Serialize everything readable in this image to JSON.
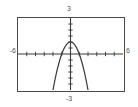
{
  "graph": {
    "window": {
      "xmin_label": "-6",
      "xmax_label": "6",
      "ymin_label": "-3",
      "ymax_label": "3"
    }
  },
  "chart_data": {
    "type": "line",
    "title": "",
    "subtitle": "",
    "xlabel": "",
    "ylabel": "",
    "xlim": [
      -6,
      6
    ],
    "ylim": [
      -3,
      3
    ],
    "grid": false,
    "legend": null,
    "axes": {
      "x_axis_visible": true,
      "y_axis_visible": true,
      "x_tick_labels": [
        "-6",
        "6"
      ],
      "y_tick_labels": [
        "-3",
        "3"
      ],
      "x_tick_interval": 1,
      "y_tick_interval": 0.5,
      "x_ticks": [
        -5,
        -4,
        -3,
        -2,
        -1,
        1,
        2,
        3,
        4,
        5
      ],
      "y_ticks": [
        -2.5,
        -2,
        -1.5,
        -1,
        -0.5,
        0.5,
        1,
        1.5,
        2,
        2.5
      ]
    },
    "series": [
      {
        "name": "parabola",
        "equation": "y = 1 - x^2",
        "color": "#3a3a3a",
        "vertex": [
          0,
          1
        ],
        "x_intercepts": [
          -1,
          1
        ],
        "y_intercept": 1,
        "opens": "down",
        "x": [
          -2.0,
          -1.9,
          -1.8,
          -1.7,
          -1.6,
          -1.5,
          -1.4,
          -1.3,
          -1.2,
          -1.1,
          -1.0,
          -0.9,
          -0.8,
          -0.7,
          -0.6,
          -0.5,
          -0.4,
          -0.3,
          -0.2,
          -0.1,
          0.0,
          0.1,
          0.2,
          0.3,
          0.4,
          0.5,
          0.6,
          0.7,
          0.8,
          0.9,
          1.0,
          1.1,
          1.2,
          1.3,
          1.4,
          1.5,
          1.6,
          1.7,
          1.8,
          1.9,
          2.0
        ],
        "values": [
          -3.0,
          -2.61,
          -2.24,
          -1.89,
          -1.56,
          -1.25,
          -0.96,
          -0.69,
          -0.44,
          -0.21,
          0.0,
          0.19,
          0.36,
          0.51,
          0.64,
          0.75,
          0.84,
          0.91,
          0.96,
          0.99,
          1.0,
          0.99,
          0.96,
          0.91,
          0.84,
          0.75,
          0.64,
          0.51,
          0.36,
          0.19,
          0.0,
          -0.21,
          -0.44,
          -0.69,
          -0.96,
          -1.25,
          -1.56,
          -1.89,
          -2.24,
          -2.61,
          -3.0
        ]
      }
    ]
  }
}
